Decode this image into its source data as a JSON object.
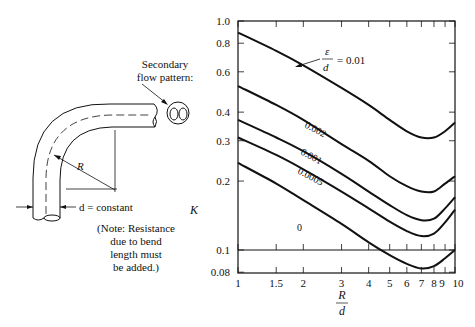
{
  "figure": {
    "secondary_flow_label": [
      "Secondary",
      "flow pattern:"
    ],
    "radius_label": "R",
    "diameter_label": "d = constant",
    "note": [
      "(Note: Resistance",
      "due to bend",
      "length must",
      "be added.)"
    ]
  },
  "chart_data": {
    "type": "line",
    "title": "",
    "xlabel": "R/d",
    "ylabel": "K",
    "xscale": "log",
    "yscale": "log",
    "xlim": [
      1,
      10
    ],
    "ylim": [
      0.08,
      1.0
    ],
    "grid": false,
    "x_ticks": [
      "1",
      "1.5",
      "2",
      "3",
      "4",
      "5",
      "6",
      "7",
      "8",
      "9",
      "10"
    ],
    "y_ticks": [
      "1.0",
      "0.8",
      "0.6",
      "0.4",
      "0.3",
      "0.2",
      "0.1",
      "0.08"
    ],
    "reference_line": {
      "y": 0.1
    },
    "legend_title": "ε/d",
    "x": [
      1,
      1.5,
      2,
      3,
      4,
      5,
      6,
      7,
      8,
      9,
      10
    ],
    "series": [
      {
        "name": "0.01",
        "label": "ε/d = 0.01",
        "values": [
          0.89,
          0.74,
          0.64,
          0.51,
          0.43,
          0.37,
          0.33,
          0.31,
          0.31,
          0.33,
          0.36
        ]
      },
      {
        "name": "0.002",
        "label": "0.002",
        "values": [
          0.52,
          0.43,
          0.37,
          0.29,
          0.245,
          0.21,
          0.19,
          0.18,
          0.18,
          0.195,
          0.21
        ]
      },
      {
        "name": "0.001",
        "label": "0.001",
        "values": [
          0.37,
          0.31,
          0.27,
          0.215,
          0.18,
          0.157,
          0.142,
          0.135,
          0.137,
          0.152,
          0.17
        ]
      },
      {
        "name": "0.0005",
        "label": "0.0005",
        "values": [
          0.31,
          0.26,
          0.225,
          0.18,
          0.152,
          0.133,
          0.121,
          0.115,
          0.118,
          0.132,
          0.15
        ]
      },
      {
        "name": "0",
        "label": "0",
        "values": [
          0.24,
          0.195,
          0.165,
          0.13,
          0.108,
          0.095,
          0.087,
          0.083,
          0.085,
          0.092,
          0.1
        ]
      }
    ]
  }
}
